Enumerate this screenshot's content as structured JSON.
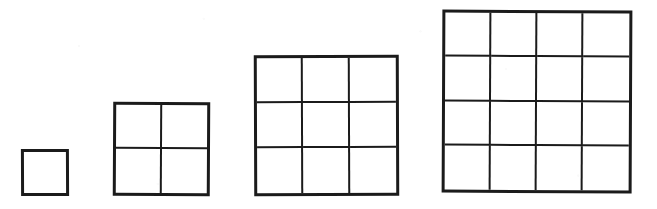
{
  "figure": {
    "canvas": {
      "width": 657,
      "height": 209
    },
    "ink_color": "#1b1b1b",
    "background_color": "#ffffff"
  },
  "chart_data": {
    "type": "diagram",
    "xlabel": "",
    "ylabel": "",
    "categories": [
      "1",
      "2",
      "3",
      "4"
    ],
    "values": [
      1,
      4,
      9,
      16
    ],
    "series": [
      {
        "name": "side length (units)",
        "values": [
          1,
          2,
          3,
          4
        ]
      },
      {
        "name": "unit cells (square number)",
        "values": [
          1,
          4,
          9,
          16
        ]
      }
    ],
    "legend_position": "none",
    "grid": true
  },
  "figures": [
    {
      "id": "grid-1x1",
      "label": "1 by 1 square",
      "n": 1,
      "cells": 1,
      "left": 21,
      "top": 149,
      "width": 48,
      "height": 47,
      "outer_border": 3,
      "inner_border": 2
    },
    {
      "id": "grid-2x2",
      "label": "2 by 2 square",
      "n": 2,
      "cells": 4,
      "left": 113,
      "top": 102,
      "width": 97,
      "height": 94,
      "outer_border": 3,
      "inner_border": 2
    },
    {
      "id": "grid-3x3",
      "label": "3 by 3 square",
      "n": 3,
      "cells": 9,
      "left": 254,
      "top": 55,
      "width": 145,
      "height": 141,
      "outer_border": 3,
      "inner_border": 2
    },
    {
      "id": "grid-4x4",
      "label": "4 by 4 square",
      "n": 4,
      "cells": 16,
      "left": 442,
      "top": 10,
      "width": 190,
      "height": 183,
      "outer_border": 3,
      "inner_border": 2
    }
  ]
}
